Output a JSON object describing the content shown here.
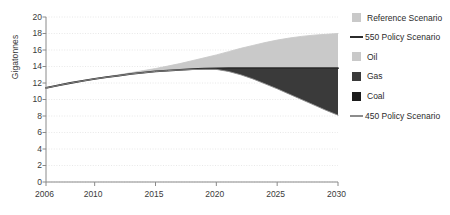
{
  "chart_data": {
    "type": "area",
    "title": "",
    "xlabel": "",
    "ylabel": "Gigatonnes",
    "xlim": [
      2006,
      2030
    ],
    "ylim": [
      0,
      20
    ],
    "grid": true,
    "legend_position": "right",
    "xticks": [
      2006,
      2010,
      2015,
      2020,
      2025,
      2030
    ],
    "xtick_labels": [
      "2006",
      "2010",
      "2015",
      "2020",
      "2025",
      "2030"
    ],
    "yticks": [
      0,
      2,
      4,
      6,
      8,
      10,
      12,
      14,
      16,
      18,
      20
    ],
    "ytick_labels": [
      "0",
      "2",
      "4",
      "6",
      "8",
      "10",
      "12",
      "14",
      "16",
      "18",
      "20"
    ],
    "x": [
      2006,
      2007,
      2008,
      2009,
      2010,
      2011,
      2012,
      2013,
      2014,
      2015,
      2016,
      2017,
      2018,
      2019,
      2020,
      2021,
      2022,
      2023,
      2024,
      2025,
      2026,
      2027,
      2028,
      2029,
      2030
    ],
    "series": [
      {
        "name": "Reference Scenario",
        "type": "line-upper-bound",
        "color": "#c9c9c9",
        "values": [
          11.4,
          11.7,
          12.0,
          12.25,
          12.5,
          12.75,
          13.0,
          13.25,
          13.5,
          13.75,
          14.05,
          14.35,
          14.7,
          15.05,
          15.4,
          15.8,
          16.2,
          16.55,
          16.9,
          17.2,
          17.45,
          17.65,
          17.8,
          17.9,
          18.0
        ]
      },
      {
        "name": "550 Policy Scenario",
        "type": "line",
        "color": "#2b2b2b",
        "values": [
          11.4,
          11.7,
          12.0,
          12.25,
          12.5,
          12.7,
          12.9,
          13.1,
          13.25,
          13.4,
          13.5,
          13.6,
          13.68,
          13.74,
          13.78,
          13.8,
          13.8,
          13.8,
          13.8,
          13.8,
          13.8,
          13.8,
          13.8,
          13.8,
          13.8
        ]
      },
      {
        "name": "450 Policy Scenario",
        "type": "line-lower-bound",
        "color": "#8c8c8c",
        "values": [
          11.4,
          11.7,
          12.0,
          12.25,
          12.5,
          12.7,
          12.9,
          13.1,
          13.25,
          13.4,
          13.5,
          13.58,
          13.63,
          13.66,
          13.65,
          13.4,
          13.0,
          12.5,
          11.9,
          11.3,
          10.65,
          10.0,
          9.35,
          8.7,
          8.1
        ]
      }
    ],
    "bands": [
      {
        "name": "Oil",
        "color": "#c9c9c9",
        "description": "Light grey wedge between Reference Scenario and 550 Policy Scenario curves",
        "upper": [
          11.4,
          11.7,
          12.0,
          12.25,
          12.5,
          12.75,
          13.0,
          13.25,
          13.5,
          13.75,
          14.05,
          14.35,
          14.7,
          15.05,
          15.4,
          15.8,
          16.2,
          16.55,
          16.9,
          17.2,
          17.45,
          17.65,
          17.8,
          17.9,
          18.0
        ],
        "lower": [
          11.4,
          11.7,
          12.0,
          12.25,
          12.5,
          12.7,
          12.9,
          13.1,
          13.25,
          13.4,
          13.5,
          13.6,
          13.68,
          13.74,
          13.78,
          13.8,
          13.8,
          13.8,
          13.8,
          13.8,
          13.8,
          13.8,
          13.8,
          13.8,
          13.8
        ]
      },
      {
        "name": "Gas",
        "color": "#3a3a3a",
        "description": "Dark grey wedge between 550 Policy Scenario and 450 Policy Scenario curves",
        "upper": [
          11.4,
          11.7,
          12.0,
          12.25,
          12.5,
          12.7,
          12.9,
          13.1,
          13.25,
          13.4,
          13.5,
          13.6,
          13.68,
          13.74,
          13.78,
          13.8,
          13.8,
          13.8,
          13.8,
          13.8,
          13.8,
          13.8,
          13.8,
          13.8,
          13.8
        ],
        "lower": [
          11.4,
          11.7,
          12.0,
          12.25,
          12.5,
          12.7,
          12.9,
          13.1,
          13.25,
          13.4,
          13.5,
          13.58,
          13.63,
          13.66,
          13.65,
          13.4,
          13.0,
          12.5,
          11.9,
          11.3,
          10.65,
          10.0,
          9.35,
          8.7,
          8.1
        ]
      },
      {
        "name": "Coal",
        "color": "#1c1c1c",
        "description": "Darkest wedge, lowest abatement band",
        "upper": [
          11.4,
          11.7,
          12.0,
          12.25,
          12.5,
          12.7,
          12.9,
          13.1,
          13.25,
          13.4,
          13.5,
          13.58,
          13.63,
          13.66,
          13.65,
          13.4,
          13.0,
          12.5,
          11.9,
          11.3,
          10.65,
          10.0,
          9.35,
          8.7,
          8.1
        ],
        "lower": [
          11.4,
          11.7,
          12.0,
          12.25,
          12.5,
          12.7,
          12.9,
          13.1,
          13.25,
          13.4,
          13.5,
          13.58,
          13.63,
          13.66,
          13.65,
          13.4,
          13.0,
          12.5,
          11.9,
          11.3,
          10.65,
          10.0,
          9.35,
          8.7,
          8.1
        ]
      }
    ],
    "legend": [
      {
        "label": "Reference Scenario",
        "marker": "box",
        "color": "#c9c9c9"
      },
      {
        "label": "550 Policy Scenario",
        "marker": "line",
        "color": "#2b2b2b"
      },
      {
        "label": "Oil",
        "marker": "box",
        "color": "#c9c9c9"
      },
      {
        "label": "Gas",
        "marker": "box",
        "color": "#3a3a3a"
      },
      {
        "label": "Coal",
        "marker": "box",
        "color": "#1c1c1c"
      },
      {
        "label": "450 Policy Scenario",
        "marker": "line",
        "color": "#8c8c8c"
      }
    ]
  },
  "colors": {
    "background": "#ffffff",
    "axis": "#8a8a8a",
    "grid": "#e2e2e2",
    "text": "#2b2b2b",
    "reference": "#c9c9c9",
    "oil": "#c9c9c9",
    "gas": "#3a3a3a",
    "coal": "#1c1c1c",
    "policy550": "#2b2b2b",
    "policy450": "#8c8c8c"
  }
}
